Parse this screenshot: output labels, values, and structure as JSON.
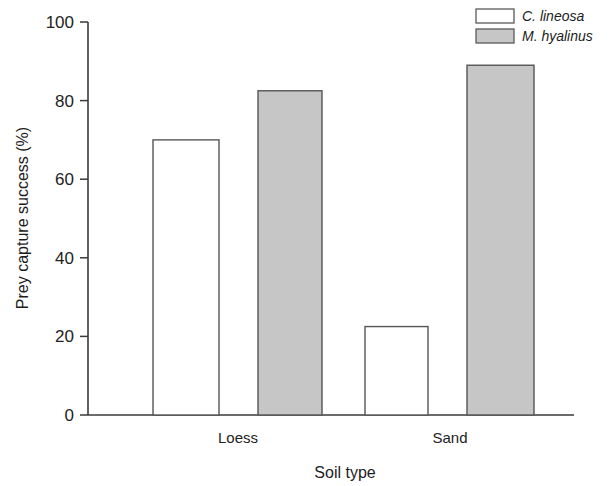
{
  "chart_data": {
    "type": "bar",
    "title": "",
    "xlabel": "Soil type",
    "ylabel": "Prey capture success (%)",
    "categories": [
      "Loess",
      "Sand"
    ],
    "series": [
      {
        "name": "C. lineosa",
        "values": [
          70,
          22.5
        ],
        "fill": "#ffffff",
        "stroke": "#555555"
      },
      {
        "name": "M. hyalinus",
        "values": [
          82.5,
          89
        ],
        "fill": "#c6c6c6",
        "stroke": "#555555"
      }
    ],
    "ylim": [
      0,
      100
    ],
    "yticks": [
      0,
      20,
      40,
      60,
      80,
      100
    ],
    "ytick_labels": [
      "0",
      "20",
      "40",
      "60",
      "80",
      "100"
    ],
    "grid": false,
    "legend_position": "top-right"
  },
  "axis": {
    "y_title": "Prey capture success (%)",
    "x_title": "Soil type",
    "ticks": {
      "t0": "0",
      "t20": "20",
      "t40": "40",
      "t60": "60",
      "t80": "80",
      "t100": "100"
    }
  },
  "categories": {
    "c0": "Loess",
    "c1": "Sand"
  },
  "legend": {
    "entries": [
      {
        "label": "C. lineosa"
      },
      {
        "label": "M. hyalinus"
      }
    ]
  },
  "colors": {
    "open_bar_fill": "#ffffff",
    "filled_bar_fill": "#c6c6c6",
    "bar_stroke": "#555555",
    "axis": "#3a3a3a",
    "text": "#1d1d1d"
  }
}
